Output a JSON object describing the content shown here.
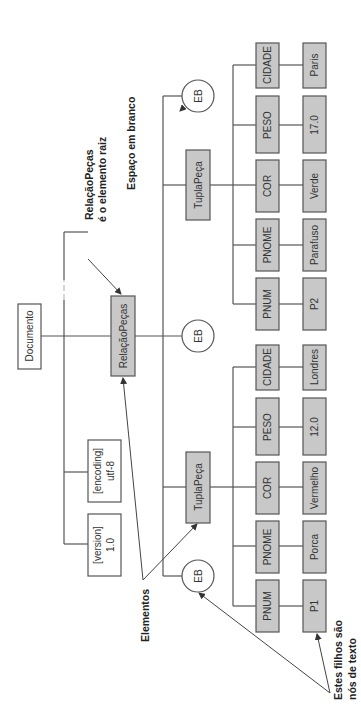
{
  "diagram": {
    "orientation": "rotated 90 degrees counterclockwise",
    "root": {
      "document": "Documento",
      "attributes": [
        {
          "name": "[version]",
          "value": "1.0"
        },
        {
          "name": "[encoding]",
          "value": "utf-8"
        }
      ],
      "root_element": "RelaçãoPeças",
      "whitespace_label": "EB"
    },
    "tuples": [
      {
        "label": "TuplaPeça",
        "fields": [
          {
            "name": "PNUM",
            "value": "P1"
          },
          {
            "name": "PNOME",
            "value": "Porca"
          },
          {
            "name": "COR",
            "value": "Vermelho"
          },
          {
            "name": "PESO",
            "value": "12.0"
          },
          {
            "name": "CIDADE",
            "value": "Londres"
          }
        ]
      },
      {
        "label": "TuplaPeça",
        "fields": [
          {
            "name": "PNUM",
            "value": "P2"
          },
          {
            "name": "PNOME",
            "value": "Parafuso"
          },
          {
            "name": "COR",
            "value": "Verde"
          },
          {
            "name": "PESO",
            "value": "17.0"
          },
          {
            "name": "CIDADE",
            "value": "Paris"
          }
        ]
      }
    ],
    "whitespace_nodes": [
      "EB",
      "EB",
      "EB"
    ],
    "annotations": {
      "root_note_line1": "RelaçãoPeças",
      "root_note_line2": "é o elemento raiz",
      "whitespace_note": "Espaço em branco",
      "elements_note": "Elementos",
      "text_nodes_line1": "Estes filhos são",
      "text_nodes_line2": "nós de texto"
    },
    "colors": {
      "element_fill": "#c8c8c8",
      "plain_fill": "#ffffff",
      "stroke": "#555555"
    }
  }
}
